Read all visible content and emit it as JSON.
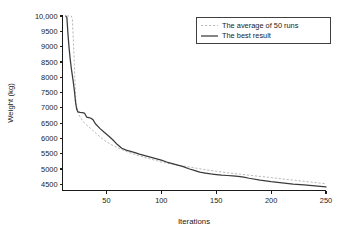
{
  "figure": {
    "background_color": "#ffffff",
    "width": 341,
    "height": 231
  },
  "chart_data": {
    "type": "line",
    "title": "",
    "xlabel": "Iterations",
    "ylabel": "Weight (kg)",
    "xlim": [
      10,
      250
    ],
    "ylim": [
      4300,
      10000
    ],
    "grid": false,
    "legend_position": "top-right",
    "xticks": [
      50,
      100,
      150,
      200,
      250
    ],
    "xtick_labels": [
      "50",
      "100",
      "150",
      "200",
      "250"
    ],
    "yticks": [
      4500,
      5000,
      5500,
      6000,
      6500,
      7000,
      7500,
      8000,
      8500,
      9000,
      9500,
      10000
    ],
    "ytick_labels": [
      "4500",
      "5000",
      "5500",
      "6000",
      "6500",
      "7000",
      "7500",
      "8000",
      "8500",
      "9000",
      "9500",
      "10,000"
    ],
    "series": [
      {
        "name": "The average of 50 runs",
        "style": "dashed",
        "color": "#b9b9b9",
        "x": [
          14,
          15,
          16,
          17,
          18,
          19,
          20,
          21,
          22,
          24,
          26,
          28,
          30,
          34,
          38,
          42,
          46,
          50,
          55,
          60,
          65,
          70,
          75,
          80,
          85,
          90,
          95,
          100,
          110,
          120,
          130,
          140,
          150,
          160,
          170,
          180,
          190,
          200,
          210,
          220,
          230,
          240,
          250
        ],
        "y": [
          10000,
          10000,
          10000,
          10000,
          10000,
          9900,
          9100,
          8200,
          7300,
          6850,
          6700,
          6600,
          6500,
          6380,
          6250,
          6120,
          6000,
          5890,
          5790,
          5700,
          5620,
          5550,
          5490,
          5430,
          5380,
          5330,
          5280,
          5230,
          5160,
          5100,
          5040,
          4980,
          4930,
          4880,
          4840,
          4800,
          4760,
          4720,
          4680,
          4640,
          4600,
          4560,
          4520
        ]
      },
      {
        "name": "The best result",
        "style": "solid",
        "color": "#3a3a3a",
        "x": [
          13,
          14,
          15,
          16,
          17,
          18,
          19,
          20,
          21,
          22,
          23,
          24,
          26,
          28,
          30,
          32,
          34,
          36,
          38,
          40,
          44,
          48,
          52,
          56,
          60,
          64,
          68,
          72,
          76,
          80,
          85,
          90,
          95,
          100,
          105,
          110,
          115,
          120,
          125,
          130,
          135,
          140,
          145,
          150,
          155,
          160,
          165,
          170,
          175,
          180,
          190,
          200,
          210,
          220,
          230,
          240,
          250
        ],
        "y": [
          10000,
          9950,
          9400,
          8950,
          8600,
          8300,
          8050,
          7800,
          7500,
          7150,
          6950,
          6870,
          6850,
          6840,
          6830,
          6700,
          6680,
          6660,
          6600,
          6480,
          6330,
          6200,
          6080,
          5950,
          5800,
          5680,
          5620,
          5580,
          5540,
          5490,
          5440,
          5390,
          5340,
          5290,
          5230,
          5180,
          5130,
          5080,
          5010,
          4960,
          4900,
          4870,
          4840,
          4820,
          4800,
          4790,
          4780,
          4760,
          4740,
          4700,
          4640,
          4590,
          4550,
          4510,
          4480,
          4450,
          4420
        ]
      }
    ],
    "legend_entries": [
      {
        "label": "The average of 50 runs",
        "style": "dashed",
        "color": "#b9b9b9"
      },
      {
        "label": "The best result",
        "style": "solid",
        "color": "#3a3a3a"
      }
    ]
  }
}
